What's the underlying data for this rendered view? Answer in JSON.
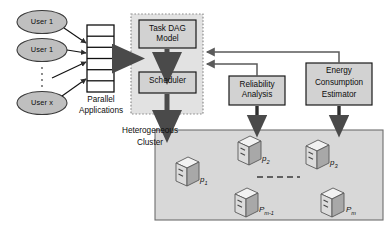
{
  "diagram": {
    "colors": {
      "box_fill": "#d2d2d2",
      "box_stroke": "#1a1a1a",
      "panel_fill": "#e2e2e2",
      "panel_dash_stroke": "#8c8c8c",
      "cluster_fill": "#d8d8d8",
      "cluster_stroke": "#6e6e6e",
      "ellipse_fill": "#bfbfbf",
      "ellipse_stroke": "#3a3a3a",
      "queue_fill": "#ffffff",
      "queue_stroke": "#101010",
      "arrow_fill": "#4a4a4a",
      "thin_arrow": "#5a5a5a",
      "node_fill": "#dcdcdc",
      "node_top": "#f2f2f2",
      "node_side": "#a8a8a8",
      "text": "#0d0d0d"
    },
    "users": [
      {
        "id": "user-1",
        "label": "User 1"
      },
      {
        "id": "user-2",
        "label": "User 1"
      },
      {
        "id": "user-x",
        "label": "User x"
      }
    ],
    "queue": {
      "name": "parallel-applications-queue",
      "cell_count": 6
    },
    "captions": {
      "parallel_applications_line1": "Parallel",
      "parallel_applications_line2": "Applications",
      "heterogeneous_cluster_line1": "Heterogeneous",
      "heterogeneous_cluster_line2": "Cluster"
    },
    "boxes": {
      "task_dag_model": {
        "line1": "Task DAG",
        "line2": "Model"
      },
      "scheduler": {
        "line1": "Scheduler"
      },
      "reliability_analysis": {
        "line1": "Reliability",
        "line2": "Analysis"
      },
      "energy_consumption_estimator": {
        "line1": "Energy",
        "line2": "Consumption",
        "line3": "Estimator"
      }
    },
    "cluster_nodes": [
      {
        "id": "node-p1",
        "name": "p",
        "sub": "1"
      },
      {
        "id": "node-p2",
        "name": "p",
        "sub": "2"
      },
      {
        "id": "node-p3",
        "name": "p",
        "sub": "3"
      },
      {
        "id": "node-pm-1",
        "name": "P",
        "sub": "m-1"
      },
      {
        "id": "node-pm",
        "name": "P",
        "sub": "m"
      }
    ],
    "ellipsis": {
      "vertical_users": "⋮",
      "horizontal_nodes": "- - - -"
    }
  }
}
